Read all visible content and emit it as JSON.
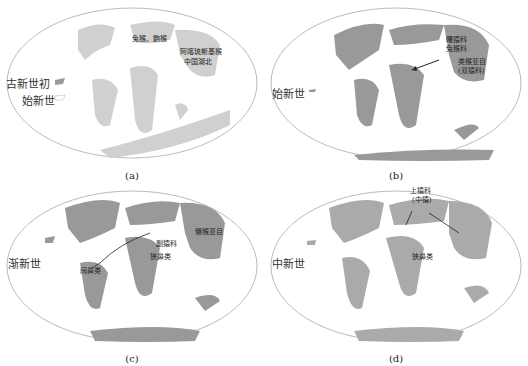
{
  "panels": [
    {
      "caption": "(a)",
      "epochs": [
        "古新世初",
        "始新世"
      ],
      "labels": [
        "兔猴、鼩猴",
        "阿喀琉斯基猴",
        "中国湖北"
      ]
    },
    {
      "caption": "(b)",
      "epochs": [
        "始新世"
      ],
      "labels": [
        "曙猿科",
        "兔猴科",
        "类猴亚目",
        "(双猿科)"
      ]
    },
    {
      "caption": "(c)",
      "epochs": [
        "渐新世"
      ],
      "labels": [
        "懒猴亚目",
        "副猿科",
        "狭鼻类",
        "阔鼻类"
      ]
    },
    {
      "caption": "(d)",
      "epochs": [
        "中新世"
      ],
      "labels": [
        "上猿科",
        "(中猿)",
        "狭鼻类"
      ]
    }
  ],
  "colors": {
    "land": "#aaaaaa",
    "land_light": "#d4d4d4",
    "ocean": "#ffffff",
    "outline": "#bbbbbb"
  }
}
